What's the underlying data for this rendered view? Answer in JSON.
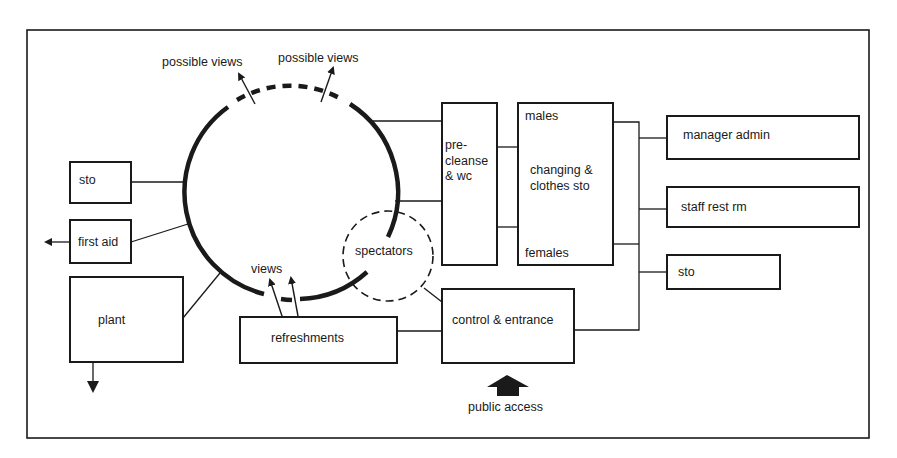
{
  "diagram": {
    "type": "architectural bubble / adjacency diagram",
    "colors": {
      "line": "#1a1a1a",
      "background": "#ffffff"
    },
    "nodes": {
      "pool_top_label_left": "possible views",
      "pool_top_label_right": "possible views",
      "sto_left": "sto",
      "first_aid": "first aid",
      "plant": "plant",
      "views": "views",
      "refreshments": "refreshments",
      "spectators": "spectators",
      "pre_cleanse": "pre-\ncleanse\n& wc",
      "pre_cleanse_lines": [
        "pre-",
        "cleanse",
        "& wc"
      ],
      "males": "males",
      "changing": [
        "changing &",
        "clothes sto"
      ],
      "females": "females",
      "control_entrance": "control & entrance",
      "public_access": "public access",
      "manager_admin": "manager admin",
      "staff_rest": "staff rest rm",
      "sto_right": "sto"
    }
  }
}
